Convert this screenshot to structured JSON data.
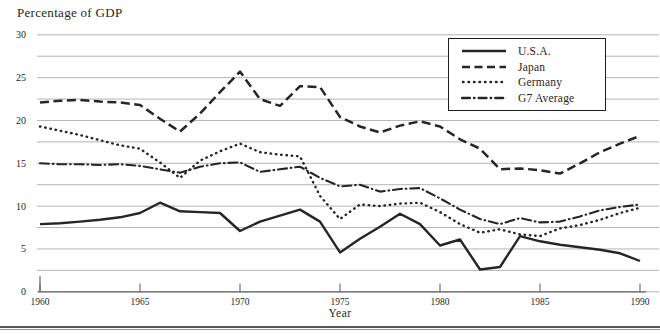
{
  "chart_data": {
    "type": "line",
    "y_axis_title": "Percentage of GDP",
    "xlabel": "Year",
    "ylim": [
      0,
      30
    ],
    "xlim": [
      1960,
      1990
    ],
    "y_tick_labels": [
      0,
      5,
      10,
      15,
      20,
      25,
      30
    ],
    "x_tick_labels": [
      1960,
      1965,
      1970,
      1975,
      1980,
      1985,
      1990
    ],
    "gridline_step": 2.5,
    "grid": "horizontal",
    "legend_position": "top-right",
    "line_color": "#262626",
    "grid_color": "#ababab",
    "axis_color": "#666666",
    "text_color": "#1f1f1f",
    "years": [
      1960,
      1961,
      1962,
      1963,
      1964,
      1965,
      1966,
      1967,
      1968,
      1969,
      1970,
      1971,
      1972,
      1973,
      1974,
      1975,
      1976,
      1977,
      1978,
      1979,
      1980,
      1981,
      1982,
      1983,
      1984,
      1985,
      1986,
      1987,
      1988,
      1989,
      1990
    ],
    "series": [
      {
        "name": "U.S.A.",
        "style": "solid",
        "values": [
          7.9,
          8.0,
          8.2,
          8.4,
          8.7,
          9.2,
          10.4,
          9.4,
          9.3,
          9.2,
          7.1,
          8.2,
          8.9,
          9.6,
          8.2,
          4.6,
          6.2,
          7.6,
          9.1,
          7.9,
          5.4,
          6.1,
          2.6,
          2.9,
          6.5,
          5.9,
          5.5,
          5.2,
          4.9,
          4.5,
          3.6
        ]
      },
      {
        "name": "Japan",
        "style": "dashed",
        "values": [
          22.1,
          22.3,
          22.4,
          22.2,
          22.1,
          21.8,
          20.2,
          18.7,
          20.8,
          23.3,
          25.7,
          22.5,
          21.7,
          24.0,
          23.9,
          20.4,
          19.3,
          18.6,
          19.4,
          19.9,
          19.3,
          17.8,
          16.7,
          14.3,
          14.4,
          14.2,
          13.8,
          15.0,
          16.3,
          17.3,
          18.2
        ]
      },
      {
        "name": "Germany",
        "style": "dotted",
        "values": [
          19.3,
          18.8,
          18.3,
          17.7,
          17.1,
          16.7,
          15.1,
          13.3,
          15.3,
          16.4,
          17.3,
          16.3,
          16.0,
          15.8,
          11.2,
          8.5,
          10.2,
          10.0,
          10.3,
          10.4,
          9.3,
          7.9,
          6.9,
          7.3,
          6.7,
          6.5,
          7.4,
          7.8,
          8.4,
          9.2,
          9.8
        ]
      },
      {
        "name": "G7 Average",
        "style": "dashdot",
        "values": [
          15.0,
          14.9,
          14.9,
          14.8,
          14.9,
          14.7,
          14.3,
          13.9,
          14.6,
          15.0,
          15.1,
          14.0,
          14.3,
          14.6,
          13.3,
          12.3,
          12.5,
          11.7,
          12.0,
          12.1,
          10.9,
          9.6,
          8.5,
          7.9,
          8.6,
          8.1,
          8.2,
          8.8,
          9.5,
          9.9,
          10.2
        ]
      }
    ]
  }
}
